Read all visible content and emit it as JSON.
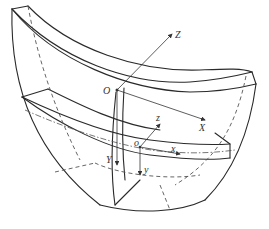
{
  "diagram": {
    "type": "3d-shell-segment-with-coordinate-systems",
    "global_axes": {
      "origin": "O",
      "x": "X",
      "y": "Y",
      "z": "Z"
    },
    "local_axes": {
      "origin": "o",
      "x": "x",
      "y": "y",
      "z": "z"
    },
    "colors": {
      "line": "#2a2a2a",
      "hidden_line": "#555555",
      "background": "#ffffff"
    }
  }
}
